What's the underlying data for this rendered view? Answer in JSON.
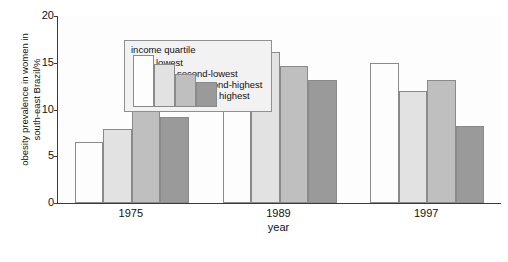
{
  "chart_data": {
    "type": "bar",
    "title": "",
    "xlabel": "year",
    "ylabel": "obesity prevalence in women in\nsouth-east Brazil/%",
    "categories": [
      "1975",
      "1989",
      "1997"
    ],
    "ylim": [
      0,
      20
    ],
    "yticks": [
      0,
      5,
      10,
      15,
      20
    ],
    "ytick_labels": [
      "0",
      "5",
      "10",
      "15",
      "20"
    ],
    "grid": false,
    "legend_position": "upper-left-inside",
    "legend_title": "income quartile",
    "series": [
      {
        "name": "lowest",
        "color": "#fdfdfd",
        "values": [
          6.5,
          11.3,
          15.0
        ]
      },
      {
        "name": "second-lowest",
        "color": "#e2e2e2",
        "values": [
          7.9,
          16.2,
          12.0
        ]
      },
      {
        "name": "second-highest",
        "color": "#bfbfbf",
        "values": [
          10.2,
          14.7,
          13.2
        ]
      },
      {
        "name": "highest",
        "color": "#9a9a9a",
        "values": [
          9.2,
          13.2,
          8.2
        ]
      }
    ]
  },
  "axis": {
    "y_label_text": "obesity prevalence in women in\nsouth-east Brazil/%",
    "x_label_text": "year"
  },
  "legend": {
    "title": "income quartile",
    "entries": [
      {
        "label": "lowest"
      },
      {
        "label": "second-lowest"
      },
      {
        "label": "second-highest"
      },
      {
        "label": "highest"
      }
    ]
  }
}
